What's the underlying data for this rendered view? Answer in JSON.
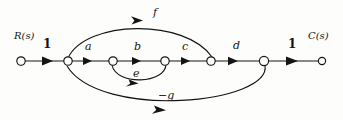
{
  "figure": {
    "type": "signal-flow-graph",
    "background_color": "#fdfdfb",
    "stroke_color": "#141414",
    "input_label": "R(s)",
    "output_label": "C(s)",
    "input_gain": "1",
    "output_gain": "1"
  },
  "nodes": [
    {
      "id": "n0",
      "name": "input-node",
      "x": 21,
      "y": 61,
      "r": 4.2
    },
    {
      "id": "n1",
      "name": "node-1",
      "x": 68,
      "y": 61,
      "r": 4.2
    },
    {
      "id": "n2",
      "name": "node-2",
      "x": 113,
      "y": 61,
      "r": 4.2
    },
    {
      "id": "n3",
      "name": "node-3",
      "x": 165,
      "y": 61,
      "r": 4.2
    },
    {
      "id": "n4",
      "name": "node-4",
      "x": 211,
      "y": 61,
      "r": 4.2
    },
    {
      "id": "n5",
      "name": "node-5",
      "x": 264,
      "y": 61,
      "r": 4.6
    },
    {
      "id": "n6",
      "name": "output-node",
      "x": 322,
      "y": 61,
      "r": 3.6
    }
  ],
  "branches": [
    {
      "id": "b_in",
      "gain": "1",
      "from": "n0",
      "to": "n1",
      "shape": "straight"
    },
    {
      "id": "b_a",
      "gain": "a",
      "from": "n1",
      "to": "n2",
      "shape": "straight"
    },
    {
      "id": "b_b",
      "gain": "b",
      "from": "n2",
      "to": "n3",
      "shape": "straight"
    },
    {
      "id": "b_c",
      "gain": "c",
      "from": "n3",
      "to": "n4",
      "shape": "straight"
    },
    {
      "id": "b_d",
      "gain": "d",
      "from": "n4",
      "to": "n5",
      "shape": "straight"
    },
    {
      "id": "b_out",
      "gain": "1",
      "from": "n5",
      "to": "n6",
      "shape": "straight"
    },
    {
      "id": "b_f",
      "gain": "f",
      "from": "n1",
      "to": "n4",
      "shape": "arc-above"
    },
    {
      "id": "b_e",
      "gain": "e",
      "from": "n3",
      "to": "n2",
      "shape": "arc-below"
    },
    {
      "id": "b_g",
      "gain": "−g",
      "from": "n5",
      "to": "n1",
      "shape": "arc-below"
    }
  ],
  "labels": {
    "input": "R(s)",
    "input_gain": "1",
    "a": "a",
    "b": "b",
    "c": "c",
    "d": "d",
    "e": "e",
    "f": "f",
    "g": "−g",
    "output_gain": "1",
    "output": "C(s)"
  },
  "label_positions": {
    "input": {
      "x": 14,
      "y": 31
    },
    "input_gain": {
      "x": 43,
      "y": 38
    },
    "a": {
      "x": 85,
      "y": 41
    },
    "b": {
      "x": 134,
      "y": 41
    },
    "c": {
      "x": 182,
      "y": 41
    },
    "d": {
      "x": 233,
      "y": 40
    },
    "e": {
      "x": 133,
      "y": 68
    },
    "f": {
      "x": 153,
      "y": 7
    },
    "g": {
      "x": 158,
      "y": 90
    },
    "output_gain": {
      "x": 288,
      "y": 38
    },
    "output": {
      "x": 308,
      "y": 31
    }
  }
}
